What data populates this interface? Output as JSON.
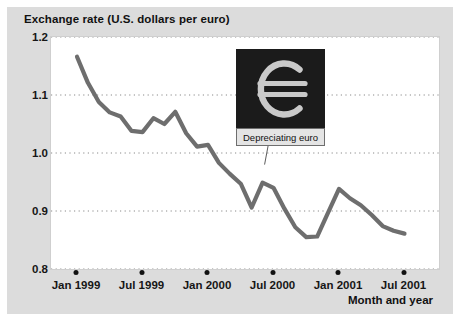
{
  "chart_data": {
    "type": "line",
    "title": "Exchange rate (U.S. dollars per euro)",
    "xlabel": "Month and year",
    "ylabel": "Exchange rate (U.S. dollars per euro)",
    "ylim": [
      0.8,
      1.2
    ],
    "yticks": [
      "1.2",
      "1.1",
      "1.0",
      "0.9",
      "0.8"
    ],
    "ytick_values": [
      1.2,
      1.1,
      1.0,
      0.9,
      0.8
    ],
    "xticks": [
      "Jan 1999",
      "Jul 1999",
      "Jan 2000",
      "Jul 2000",
      "Jan 2001",
      "Jul 2001"
    ],
    "xtick_indices": [
      0,
      6,
      12,
      18,
      24,
      30
    ],
    "grid": "horizontal-dotted",
    "legend": "none",
    "line_color": "#6e6e6e",
    "series": [
      {
        "name": "U.S. dollars per euro",
        "x": [
          "Jan 1999",
          "Feb 1999",
          "Mar 1999",
          "Apr 1999",
          "May 1999",
          "Jun 1999",
          "Jul 1999",
          "Aug 1999",
          "Sep 1999",
          "Oct 1999",
          "Nov 1999",
          "Dec 1999",
          "Jan 2000",
          "Feb 2000",
          "Mar 2000",
          "Apr 2000",
          "May 2000",
          "Jun 2000",
          "Jul 2000",
          "Aug 2000",
          "Sep 2000",
          "Oct 2000",
          "Nov 2000",
          "Dec 2000",
          "Jan 2001",
          "Feb 2001",
          "Mar 2001",
          "Apr 2001",
          "May 2001",
          "Jun 2001",
          "Jul 2001"
        ],
        "values": [
          1.166,
          1.121,
          1.088,
          1.07,
          1.063,
          1.038,
          1.036,
          1.06,
          1.05,
          1.071,
          1.034,
          1.011,
          1.014,
          0.983,
          0.964,
          0.947,
          0.906,
          0.949,
          0.94,
          0.904,
          0.872,
          0.855,
          0.856,
          0.897,
          0.938,
          0.922,
          0.91,
          0.893,
          0.874,
          0.866,
          0.861
        ]
      }
    ],
    "annotations": [
      {
        "name": "euro-callout",
        "label": "Depreciating euro",
        "icon": "euro-currency-symbol",
        "points_to": "Jun 2000",
        "box_color": "#1b1b1b",
        "glyph_color": "#c9c9c9"
      }
    ]
  },
  "figure": {
    "background": "#dcdcdc",
    "plot_background": "#ffffff",
    "grid_color": "#8a8a8a"
  }
}
